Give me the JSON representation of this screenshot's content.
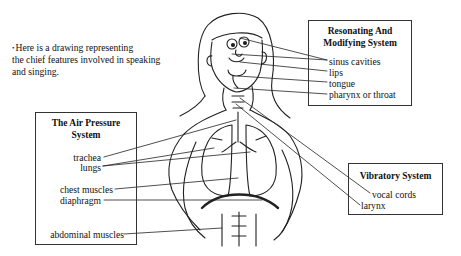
{
  "intro": {
    "bullet": "•",
    "lines": [
      "Here is a drawing representing",
      "the chief features involved in speaking",
      "and singing."
    ]
  },
  "boxes": {
    "resonating": {
      "title_line1": "Resonating And",
      "title_line2": "Modifying System",
      "labels": [
        "sinus cavities",
        "lips",
        "tongue",
        "pharynx or throat"
      ]
    },
    "air_pressure": {
      "title_line1": "The Air Pressure",
      "title_line2": "System",
      "labels": [
        "trachea",
        "lungs",
        "chest muscles",
        "diaphragm",
        "abdominal muscles"
      ]
    },
    "vibratory": {
      "title": "Vibratory System",
      "labels": [
        "vocal cords",
        "larynx"
      ]
    }
  },
  "colors": {
    "line": "#222222",
    "box_border": "#333333",
    "background": "#ffffff"
  }
}
